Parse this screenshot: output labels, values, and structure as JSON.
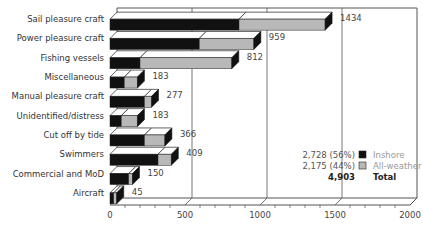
{
  "chart_data": {
    "type": "bar",
    "orientation": "horizontal",
    "stacked": true,
    "style": "3d",
    "title": "",
    "xlabel": "",
    "ylabel": "",
    "xlim": [
      0,
      2000
    ],
    "xticks": [
      0,
      500,
      1000,
      1500,
      2000
    ],
    "xtick_labels": [
      "0",
      "500",
      "1000",
      "1500",
      "2000"
    ],
    "grid": true,
    "categories": [
      "Sail pleasure craft",
      "Power pleasure craft",
      "Fishing vessels",
      "Miscellaneous",
      "Manual pleasure craft",
      "Unidentified/distress",
      "Cut off by tide",
      "Swimmers",
      "Commercial and MoD",
      "Aircraft"
    ],
    "totals": [
      1434,
      959,
      812,
      183,
      277,
      183,
      366,
      409,
      150,
      45
    ],
    "total_labels": [
      "1434",
      "959",
      "812",
      "183",
      "277",
      "183",
      "366",
      "409",
      "150",
      "45"
    ],
    "series": [
      {
        "name": "Inshore",
        "color": "#111111",
        "values": [
          860,
          595,
          200,
          95,
          230,
          75,
          230,
          320,
          125,
          25
        ]
      },
      {
        "name": "All-weather",
        "color": "#b8b8b8",
        "values": [
          574,
          364,
          612,
          88,
          47,
          108,
          136,
          89,
          25,
          20
        ]
      }
    ],
    "legend": {
      "position": "inside-right",
      "rows": [
        {
          "value": "2,728 (56%)",
          "swatch": "#111111",
          "label": "Inshore"
        },
        {
          "value": "2,175 (44%)",
          "swatch": "#b8b8b8",
          "label": "All-weather"
        },
        {
          "value": "4,903",
          "swatch": null,
          "label": "Total"
        }
      ]
    }
  }
}
